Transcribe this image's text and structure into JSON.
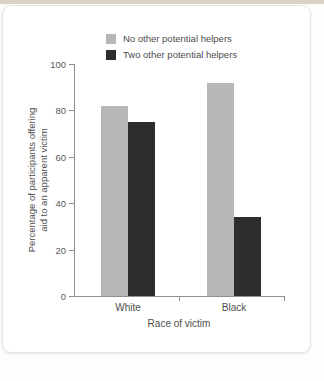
{
  "page": {
    "background": "#fdfdfc",
    "top_strip_color": "#d9d3c7",
    "panel_color": "#ffffff"
  },
  "chart_data": {
    "type": "bar",
    "title": "",
    "categories": [
      "White",
      "Black"
    ],
    "series": [
      {
        "name": "No other potential helpers",
        "color": "#b7b7b5",
        "values": [
          82,
          92
        ]
      },
      {
        "name": "Two other potential helpers",
        "color": "#2d2d2d",
        "values": [
          75,
          34
        ]
      }
    ],
    "xlabel": "Race of victim",
    "ylabel_line1": "Percentage of participants offering",
    "ylabel_line2": "aid to an apparent victim",
    "ylim": [
      0,
      100
    ],
    "yticks": [
      0,
      20,
      40,
      60,
      80,
      100
    ],
    "legend_position": "top",
    "grid": false,
    "axis_color": "#8f8f8f",
    "text_color": "#4d4d4d"
  }
}
